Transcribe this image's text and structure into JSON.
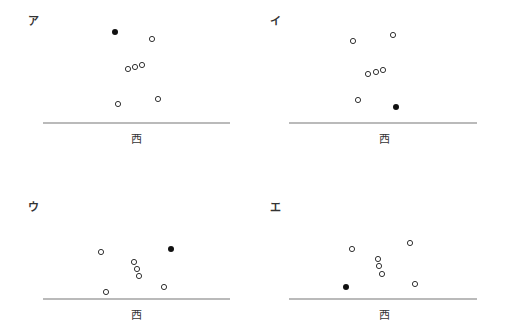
{
  "panels": [
    {
      "id": "a",
      "label": "ア",
      "axis_label": "西",
      "label_pos": [
        28,
        12
      ],
      "axis_label_pos": [
        136,
        130
      ],
      "baseline": {
        "x1": 43,
        "x2": 230,
        "y": 123
      },
      "filled": [
        [
          115,
          32
        ]
      ],
      "open": [
        [
          152,
          39
        ],
        [
          128,
          69
        ],
        [
          135,
          67
        ],
        [
          142,
          65
        ],
        [
          118,
          104
        ],
        [
          158,
          99
        ]
      ]
    },
    {
      "id": "i",
      "label": "イ",
      "axis_label": "西",
      "label_pos": [
        270,
        12
      ],
      "axis_label_pos": [
        384,
        130
      ],
      "baseline": {
        "x1": 289,
        "x2": 477,
        "y": 123
      },
      "filled": [
        [
          396,
          107
        ]
      ],
      "open": [
        [
          353,
          41
        ],
        [
          393,
          35
        ],
        [
          368,
          74
        ],
        [
          376,
          72
        ],
        [
          383,
          70
        ],
        [
          358,
          100
        ]
      ]
    },
    {
      "id": "u",
      "label": "ウ",
      "axis_label": "西",
      "label_pos": [
        28,
        198
      ],
      "axis_label_pos": [
        136,
        306
      ],
      "baseline": {
        "x1": 43,
        "x2": 230,
        "y": 299
      },
      "filled": [
        [
          171,
          249
        ]
      ],
      "open": [
        [
          101,
          252
        ],
        [
          134,
          262
        ],
        [
          137,
          269
        ],
        [
          139,
          276
        ],
        [
          106,
          292
        ],
        [
          164,
          287
        ]
      ]
    },
    {
      "id": "e",
      "label": "エ",
      "axis_label": "西",
      "label_pos": [
        270,
        198
      ],
      "axis_label_pos": [
        384,
        306
      ],
      "baseline": {
        "x1": 289,
        "x2": 477,
        "y": 299
      },
      "filled": [
        [
          346,
          287
        ]
      ],
      "open": [
        [
          352,
          249
        ],
        [
          410,
          243
        ],
        [
          378,
          259
        ],
        [
          379,
          266
        ],
        [
          382,
          274
        ],
        [
          415,
          284
        ]
      ]
    }
  ],
  "colors": {
    "line": "#777777",
    "dot": "#111111",
    "open_stroke": "#333333"
  }
}
